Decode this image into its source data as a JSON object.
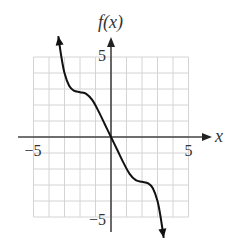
{
  "chart_data": {
    "type": "line",
    "title": "",
    "xlabel": "x",
    "ylabel": "f(x)",
    "xlim": [
      -5,
      5
    ],
    "ylim": [
      -5,
      5
    ],
    "grid": true,
    "x_ticks": [
      {
        "value": -5,
        "label": "−5"
      },
      {
        "value": 5,
        "label": "5"
      }
    ],
    "y_ticks": [
      {
        "value": 5,
        "label": "5"
      },
      {
        "value": -5,
        "label": "−5"
      }
    ],
    "series": [
      {
        "name": "f(x)",
        "points": [
          [
            -3.4,
            6.3
          ],
          [
            -3.2,
            5.0
          ],
          [
            -3.0,
            4.0
          ],
          [
            -2.7,
            3.2
          ],
          [
            -2.4,
            2.9
          ],
          [
            -2.0,
            2.8
          ],
          [
            -1.6,
            2.7
          ],
          [
            -1.2,
            2.3
          ],
          [
            -0.8,
            1.6
          ],
          [
            -0.4,
            0.8
          ],
          [
            0,
            0
          ],
          [
            0.4,
            -0.8
          ],
          [
            0.8,
            -1.6
          ],
          [
            1.2,
            -2.3
          ],
          [
            1.6,
            -2.7
          ],
          [
            2.0,
            -2.8
          ],
          [
            2.4,
            -2.9
          ],
          [
            2.7,
            -3.2
          ],
          [
            3.0,
            -4.0
          ],
          [
            3.2,
            -5.0
          ],
          [
            3.4,
            -6.3
          ]
        ],
        "arrows": "both ends"
      }
    ]
  }
}
